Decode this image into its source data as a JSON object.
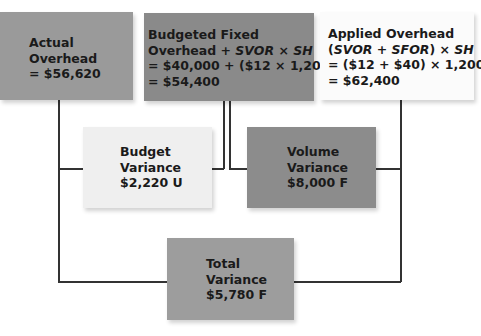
{
  "colors": {
    "actual_box": "#9a9a9a",
    "budgeted_box": "#8a8a8a",
    "applied_box": "#fbfbfb",
    "budget_variance_box": "#efefef",
    "volume_variance_box": "#8c8c8c",
    "total_variance_box": "#9d9d9d",
    "connector": "#333333"
  },
  "boxes": {
    "actual": {
      "line1": "Actual",
      "line2": "Overhead",
      "line3": "= $56,620"
    },
    "budgeted": {
      "line1": "Budgeted Fixed",
      "line2_a": "Overhead + ",
      "line2_b": "SVOR × SH",
      "line3": "= $40,000 + ($12 × 1,200)",
      "line4": "= $54,400"
    },
    "applied": {
      "line1": "Applied Overhead",
      "line2_a": "(",
      "line2_b": "SVOR + SFOR",
      "line2_c": ") × ",
      "line2_d": "SH",
      "line3": "= ($12 + $40) × 1,200",
      "line4": "= $62,400"
    },
    "budget_variance": {
      "line1": "Budget",
      "line2": "Variance",
      "line3": "$2,220 U"
    },
    "volume_variance": {
      "line1": "Volume",
      "line2": "Variance",
      "line3": "$8,000 F"
    },
    "total_variance": {
      "line1": "Total",
      "line2": "Variance",
      "line3": "$5,780 F"
    }
  }
}
